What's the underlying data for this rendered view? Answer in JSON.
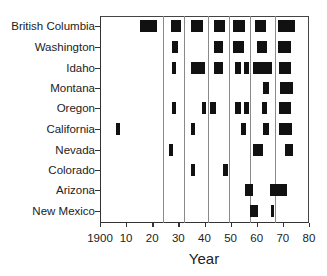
{
  "chart_data": {
    "type": "timeline",
    "title": "",
    "xlabel": "Year",
    "ylabel": "",
    "xlim": [
      1900,
      1980
    ],
    "x_ticks": [
      "1900",
      "10",
      "20",
      "30",
      "40",
      "50",
      "60",
      "70",
      "80"
    ],
    "x_tick_values": [
      1900,
      1910,
      1920,
      1930,
      1940,
      1950,
      1960,
      1970,
      1980
    ],
    "reference_lines": [
      1924,
      1932,
      1941.5,
      1949.5,
      1957.5,
      1967
    ],
    "grid": false,
    "legend": null,
    "categories": [
      "British Columbia",
      "Washington",
      "Idaho",
      "Montana",
      "Oregon",
      "California",
      "Nevada",
      "Colorado",
      "Arizona",
      "New Mexico"
    ],
    "series": [
      {
        "name": "British Columbia",
        "intervals": [
          [
            1915.5,
            1922
          ],
          [
            1927,
            1931
          ],
          [
            1935,
            1939.5
          ],
          [
            1943.5,
            1948
          ],
          [
            1951,
            1955.5
          ],
          [
            1959.5,
            1963.5
          ],
          [
            1968,
            1974.5
          ]
        ]
      },
      {
        "name": "Washington",
        "intervals": [
          [
            1927.5,
            1930
          ],
          [
            1943.5,
            1947
          ],
          [
            1951,
            1955
          ],
          [
            1960,
            1964
          ],
          [
            1968,
            1973
          ]
        ]
      },
      {
        "name": "Idaho",
        "intervals": [
          [
            1927.5,
            1929
          ],
          [
            1935,
            1940
          ],
          [
            1943.5,
            1947
          ],
          [
            1951.5,
            1954
          ],
          [
            1955,
            1957
          ],
          [
            1958.5,
            1966
          ],
          [
            1968.5,
            1973
          ]
        ]
      },
      {
        "name": "Montana",
        "intervals": [
          [
            1962.5,
            1964.5
          ],
          [
            1969,
            1974
          ]
        ]
      },
      {
        "name": "Oregon",
        "intervals": [
          [
            1927.5,
            1929
          ],
          [
            1939,
            1940.5
          ],
          [
            1942,
            1944.5
          ],
          [
            1951.5,
            1954
          ],
          [
            1955,
            1957
          ],
          [
            1962,
            1964
          ],
          [
            1968.5,
            1973
          ]
        ]
      },
      {
        "name": "California",
        "intervals": [
          [
            1906,
            1907.5
          ],
          [
            1935,
            1936.5
          ],
          [
            1954,
            1956
          ],
          [
            1962.5,
            1964.5
          ],
          [
            1968.5,
            1973.5
          ]
        ]
      },
      {
        "name": "Nevada",
        "intervals": [
          [
            1926.5,
            1928
          ],
          [
            1958.5,
            1962.5
          ],
          [
            1971,
            1974
          ]
        ]
      },
      {
        "name": "Colorado",
        "intervals": [
          [
            1935,
            1936.5
          ],
          [
            1947,
            1949
          ]
        ]
      },
      {
        "name": "Arizona",
        "intervals": [
          [
            1955.5,
            1958.5
          ],
          [
            1965,
            1971.5
          ]
        ]
      },
      {
        "name": "New Mexico",
        "intervals": [
          [
            1957.5,
            1960.5
          ],
          [
            1965.5,
            1966.5
          ]
        ]
      }
    ]
  }
}
